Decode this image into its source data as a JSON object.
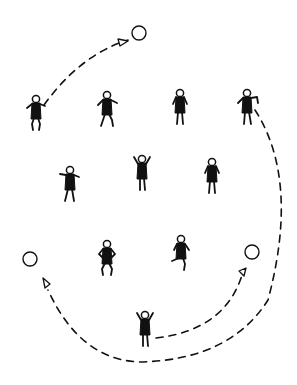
{
  "diagram": {
    "title": "",
    "background": "#ffffff",
    "ink": "#111111",
    "paths": [
      {
        "id": "top-left-arc",
        "d": "M 44 105 Q 80 55 128 40"
      },
      {
        "id": "right-outer-arc",
        "d": "M 255 110 Q 300 180 268 300 Q 230 360 140 362 Q 80 360 48 290"
      },
      {
        "id": "right-inner-arc",
        "d": "M 156 338 Q 225 330 242 275"
      }
    ],
    "markers": [
      {
        "type": "circle",
        "cx": 139,
        "cy": 33,
        "r": 7
      },
      {
        "type": "circle",
        "cx": 30,
        "cy": 259,
        "r": 7
      },
      {
        "type": "circle",
        "cx": 252,
        "cy": 252,
        "r": 7
      },
      {
        "type": "triangle",
        "points": "118,39 128,41 120,46"
      },
      {
        "type": "triangle",
        "points": "43,278 50,284 45,288"
      },
      {
        "type": "triangle",
        "points": "246,268 244,276 239,271"
      }
    ],
    "figures": [
      {
        "id": "p1",
        "x": 36,
        "y": 112,
        "pose": "crouch"
      },
      {
        "id": "p2",
        "x": 107,
        "y": 108,
        "pose": "crouch-lean"
      },
      {
        "id": "p3",
        "x": 180,
        "y": 106,
        "pose": "stand"
      },
      {
        "id": "p4",
        "x": 247,
        "y": 106,
        "pose": "lean-right"
      },
      {
        "id": "p5",
        "x": 70,
        "y": 183,
        "pose": "arms-wide"
      },
      {
        "id": "p6",
        "x": 142,
        "y": 172,
        "pose": "arms-up"
      },
      {
        "id": "p7",
        "x": 212,
        "y": 175,
        "pose": "stand"
      },
      {
        "id": "p8",
        "x": 107,
        "y": 257,
        "pose": "hands-hips"
      },
      {
        "id": "p9",
        "x": 181,
        "y": 252,
        "pose": "kick"
      },
      {
        "id": "p10",
        "x": 145,
        "y": 328,
        "pose": "arms-up"
      }
    ]
  }
}
